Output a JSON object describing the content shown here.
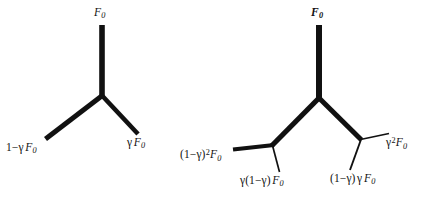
{
  "figure": {
    "title": "",
    "background_color": "#ffffff",
    "stroke_color": "#111111",
    "width": 422,
    "height": 201,
    "diagrams": [
      {
        "name": "single-split",
        "description": "Y-shaped two-way split of F0 into (1-gamma)F0 and gamma F0",
        "trunk_label": "F0",
        "branch_labels": [
          "1-gamma F0",
          "gamma F0"
        ],
        "segments": [
          {
            "name": "trunk",
            "x1": 102,
            "y1": 25,
            "x2": 102,
            "y2": 96,
            "width": 5.5
          },
          {
            "name": "left-branch",
            "x1": 102,
            "y1": 96,
            "x2": 46,
            "y2": 139,
            "width": 5.0
          },
          {
            "name": "right-branch",
            "x1": 102,
            "y1": 96,
            "x2": 138,
            "y2": 134,
            "width": 4.6
          }
        ]
      },
      {
        "name": "double-split",
        "description": "Two-level branching of F0 into (1-gamma)^2 F0, gamma(1-gamma)F0, (1-gamma)gamma F0 and gamma^2 F0",
        "trunk_label": "F0",
        "branch_labels": [
          "(1-gamma)^2 F0",
          "gamma(1-gamma) F0",
          "(1-gamma) gamma F0",
          "gamma^2 F0"
        ],
        "segments": [
          {
            "name": "trunk",
            "x1": 319,
            "y1": 25,
            "x2": 319,
            "y2": 98,
            "width": 6.0
          },
          {
            "name": "left-main",
            "x1": 319,
            "y1": 98,
            "x2": 272,
            "y2": 146,
            "width": 5.0
          },
          {
            "name": "right-main",
            "x1": 319,
            "y1": 98,
            "x2": 361,
            "y2": 140,
            "width": 5.0
          },
          {
            "name": "left-outer",
            "x1": 272,
            "y1": 146,
            "x2": 233,
            "y2": 149,
            "width": 4.2
          },
          {
            "name": "left-inner",
            "x1": 272,
            "y1": 146,
            "x2": 279,
            "y2": 172,
            "width": 1.6
          },
          {
            "name": "right-outer",
            "x1": 361,
            "y1": 140,
            "x2": 389,
            "y2": 134,
            "width": 1.6
          },
          {
            "name": "right-inner",
            "x1": 361,
            "y1": 140,
            "x2": 350,
            "y2": 170,
            "width": 1.8
          }
        ]
      }
    ]
  },
  "labels": {
    "left_top": {
      "base": "F",
      "sub": "0"
    },
    "left_bottom_left": {
      "prefix": "1−",
      "greek": "γ",
      "base": "F",
      "sub": "0"
    },
    "left_bottom_right": {
      "greek": "γ",
      "base": "F",
      "sub": "0"
    },
    "right_top": {
      "base": "F",
      "sub": "0"
    },
    "right_b1": {
      "prefix": "(1−",
      "greek": "γ",
      "mid": ")",
      "sup": "2",
      "base": "F",
      "sub": "0"
    },
    "right_b2": {
      "greek": "γ",
      "prefix": "(1−",
      "greek2": "γ",
      "mid": ")",
      "base": "F",
      "sub": "0"
    },
    "right_b3": {
      "prefix": "(1−",
      "greek": "γ",
      "mid": ")",
      "greek2": "γ",
      "base": "F",
      "sub": "0"
    },
    "right_b4": {
      "greek": "γ",
      "sup": "2",
      "base": "F",
      "sub": "0"
    }
  }
}
